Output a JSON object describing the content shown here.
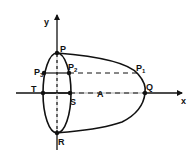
{
  "diagram": {
    "type": "geometry-figure",
    "colors": {
      "ink": "#111111",
      "background": "#ffffff"
    },
    "axes": {
      "x_label": "x",
      "y_label": "y"
    },
    "points": {
      "P": "P",
      "Q": "Q",
      "R": "R",
      "S": "S",
      "T": "T",
      "P1": {
        "base": "P",
        "sub": "1"
      },
      "P2": {
        "base": "P",
        "sub": "2"
      },
      "P3": {
        "base": "P",
        "sub": "3"
      }
    },
    "segment_label": "A"
  }
}
